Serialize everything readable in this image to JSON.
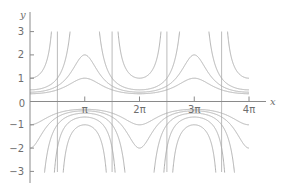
{
  "chart_data": {
    "type": "line",
    "title": "",
    "xlabel": "x",
    "ylabel": "y",
    "family": "y = 1/(cos x + c)",
    "xlim": [
      0,
      12.5664
    ],
    "ylim": [
      -3,
      3
    ],
    "grid": false,
    "legend": null,
    "x_ticks": [
      {
        "value": 3.1416,
        "label": "π"
      },
      {
        "value": 6.2832,
        "label": "2π"
      },
      {
        "value": 9.4248,
        "label": "3π"
      },
      {
        "value": 12.5664,
        "label": "4π"
      }
    ],
    "y_ticks": [
      {
        "value": 3,
        "label": "3"
      },
      {
        "value": 2,
        "label": "2"
      },
      {
        "value": 1,
        "label": "1"
      },
      {
        "value": 0,
        "label": "0"
      },
      {
        "value": -1,
        "label": "−1"
      },
      {
        "value": -2,
        "label": "−2"
      },
      {
        "value": -3,
        "label": "−3"
      }
    ],
    "vertical_asymptotes": [
      1.5708,
      4.7124,
      7.854,
      10.9956
    ],
    "series": [
      {
        "name": "c = 2",
        "c": 2,
        "branch": "all",
        "y_at": {
          "0": 0.333,
          "π": 1.0,
          "2π": 0.333,
          "3π": 1.0,
          "4π": 0.333
        }
      },
      {
        "name": "c = 1.5",
        "c": 1.5,
        "branch": "all",
        "y_at": {
          "0": 0.4,
          "π": 2.0,
          "2π": 0.4,
          "3π": 2.0,
          "4π": 0.4
        }
      },
      {
        "name": "c = 1",
        "c": 1,
        "branch": "all",
        "y_at": {
          "0": 0.5,
          "π": "∞",
          "2π": 0.5,
          "3π": "∞",
          "4π": 0.5
        }
      },
      {
        "name": "c = 0",
        "c": 0,
        "branch": "all",
        "y_at": {
          "0": 1.0,
          "π": -1.0,
          "2π": 1.0,
          "3π": -1.0,
          "4π": 1.0
        }
      },
      {
        "name": "c = -0.5",
        "c": -0.5,
        "branch": "negative",
        "y_at": {
          "π": -0.667,
          "3π": -0.667
        }
      },
      {
        "name": "c = -1",
        "c": -1,
        "branch": "all",
        "y_at": {
          "0": "-∞",
          "π": -0.5,
          "2π": "-∞",
          "3π": -0.5,
          "4π": "-∞"
        }
      },
      {
        "name": "c = -1.5",
        "c": -1.5,
        "branch": "all",
        "y_at": {
          "0": -2.0,
          "π": -0.4,
          "2π": -2.0,
          "3π": -0.4,
          "4π": -2.0
        }
      },
      {
        "name": "c = -2",
        "c": -2,
        "branch": "all",
        "y_at": {
          "0": -1.0,
          "π": -0.333,
          "2π": -1.0,
          "3π": -0.333,
          "4π": -1.0
        }
      }
    ]
  }
}
